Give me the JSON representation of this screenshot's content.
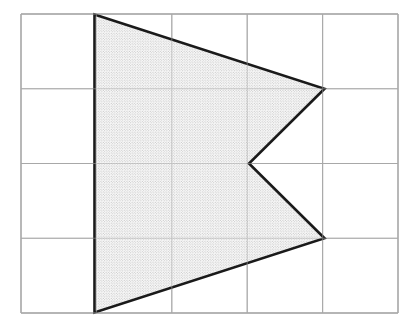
{
  "figure": {
    "type": "geometry-diagram",
    "canvas": {
      "width": 418,
      "height": 326,
      "background": "#ffffff"
    },
    "grid": {
      "label": "grid",
      "columns": 5,
      "rows": 4,
      "cell_width": 75.4,
      "cell_height": 74.75,
      "origin_x": 21,
      "origin_y": 14,
      "right_x": 398,
      "bottom_y": 313,
      "line_color": "#a8a8a8",
      "line_width": 1.1,
      "border_color": "#a8a8a8",
      "border_width": 1.4,
      "vertical_lines_x": [
        21,
        96.4,
        171.8,
        247.2,
        322.6,
        398
      ],
      "horizontal_lines_y": [
        14,
        88.75,
        163.5,
        238.25,
        313
      ]
    },
    "polygon": {
      "label": "shaded-arrowhead",
      "vertex_count": 5,
      "points_px": [
        [
          94.5,
          14.5
        ],
        [
          324.5,
          88.75
        ],
        [
          249.0,
          163.5
        ],
        [
          324.5,
          238.25
        ],
        [
          94.5,
          312.5
        ]
      ],
      "points_grid": [
        [
          1.0,
          0.0
        ],
        [
          4.0,
          1.0
        ],
        [
          3.0,
          2.0
        ],
        [
          4.0,
          3.0
        ],
        [
          1.0,
          4.0
        ]
      ],
      "stroke_color": "#1a1a1a",
      "stroke_width": 2.6,
      "fill_style": "stipple-dots",
      "fill_color": "#8c8c8c",
      "fill_background": "#fbfbfb",
      "stipple_spacing_px": 2.6,
      "stipple_dot_radius_px": 0.45
    }
  }
}
